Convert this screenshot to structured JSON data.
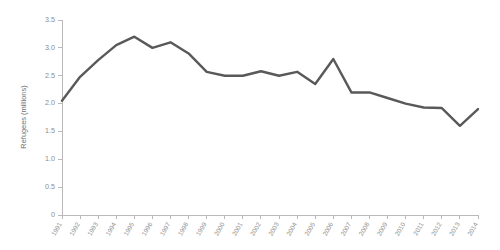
{
  "chart_data": {
    "type": "line",
    "title": "",
    "subtitle": "",
    "xlabel": "",
    "ylabel": "Refugees (millions)",
    "grid": false,
    "legend": false,
    "legend_position": "none",
    "line_color": "#595959",
    "axis_color": "#b9b9b9",
    "tick_label_color": "#8d8d8d",
    "background": "#ffffff",
    "xlim": [
      1991,
      2014
    ],
    "ylim": [
      0,
      3.5
    ],
    "ytick_values": [
      0,
      0.5,
      1.0,
      1.5,
      2.0,
      2.5,
      3.0,
      3.5
    ],
    "ytick_labels": [
      "0",
      "0.5",
      "1.0",
      "1.5",
      "2.0",
      "2.5",
      "3.0",
      "3.5"
    ],
    "xtick_rotation": 60,
    "categories": [
      "1991",
      "1992",
      "1993",
      "1994",
      "1995",
      "1996",
      "1997",
      "1998",
      "1999",
      "2000",
      "2001",
      "2002",
      "2003",
      "2004",
      "2005",
      "2006",
      "2007",
      "2008",
      "2009",
      "2010",
      "2011",
      "2012",
      "2013",
      "2014"
    ],
    "values": [
      2.05,
      2.48,
      2.78,
      3.05,
      3.2,
      3.0,
      3.1,
      2.9,
      2.57,
      2.5,
      2.5,
      2.58,
      2.5,
      2.57,
      2.35,
      2.8,
      2.2,
      2.2,
      2.1,
      2.0,
      1.93,
      1.92,
      1.6,
      1.9
    ],
    "series": [
      {
        "name": "Refugees",
        "color": "#595959",
        "values": [
          2.05,
          2.48,
          2.78,
          3.05,
          3.2,
          3.0,
          3.1,
          2.9,
          2.57,
          2.5,
          2.5,
          2.58,
          2.5,
          2.57,
          2.35,
          2.8,
          2.2,
          2.2,
          2.1,
          2.0,
          1.93,
          1.92,
          1.6,
          1.9
        ]
      }
    ],
    "annotations": []
  }
}
